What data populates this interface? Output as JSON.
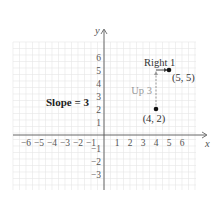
{
  "chart_data": {
    "type": "scatter",
    "title": "",
    "xlabel": "x",
    "ylabel": "y",
    "xlim": [
      -7,
      7
    ],
    "ylim": [
      -4,
      7
    ],
    "grid": true,
    "x_ticks": [
      "-6",
      "-5",
      "-4",
      "-3",
      "-2",
      "-1",
      "1",
      "2",
      "3",
      "4",
      "5",
      "6"
    ],
    "y_ticks": [
      "6",
      "5",
      "4",
      "3",
      "2",
      "1",
      "-1",
      "-2",
      "-3"
    ],
    "points": [
      {
        "x": 4,
        "y": 2,
        "label": "(4, 2)"
      },
      {
        "x": 5,
        "y": 5,
        "label": "(5, 5)"
      }
    ],
    "annotations": [
      {
        "text": "Slope = 3",
        "type": "bold-label"
      },
      {
        "text": "Up 3",
        "type": "vertical-dashed-arrow",
        "from": [
          4,
          2
        ],
        "to": [
          4,
          5
        ]
      },
      {
        "text": "Right 1",
        "type": "horizontal-arrow",
        "from": [
          4,
          5
        ],
        "to": [
          5,
          5
        ]
      }
    ]
  },
  "labels": {
    "slope": "Slope = 3",
    "up": "Up 3",
    "right": "Right 1",
    "p1": "(4, 2)",
    "p2": "(5, 5)",
    "x_axis": "x",
    "y_axis": "y"
  }
}
